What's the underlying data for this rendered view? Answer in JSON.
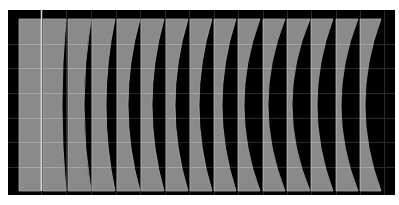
{
  "canvas": {
    "width": 399,
    "height": 205,
    "background": "#ffffff"
  },
  "panel": {
    "x": 8,
    "y": 10,
    "width": 387,
    "height": 185,
    "fill": "#000000"
  },
  "plot_area": {
    "top": 19,
    "bottom": 191
  },
  "colors": {
    "strip_fill": "#8a8a8a",
    "strip_edge": "#a8a8a8",
    "grid_on_strip": "#a4a4a4",
    "grid_on_black": "#2a2a2a",
    "highlight_line": "#d8d8d8"
  },
  "grid": {
    "horizontal_y": [
      44,
      68,
      93,
      118,
      142,
      167
    ],
    "vertical_x": [
      41,
      66,
      91,
      116,
      140,
      165,
      189,
      214,
      238,
      263,
      287,
      311,
      336,
      360,
      384
    ]
  },
  "strips": [
    {
      "left": 19,
      "top_right": 41,
      "mid_right": 41
    },
    {
      "left": 43,
      "top_right": 66,
      "mid_right": 62
    },
    {
      "left": 68,
      "top_right": 91,
      "mid_right": 84
    },
    {
      "left": 92,
      "top_right": 115,
      "mid_right": 106
    },
    {
      "left": 117,
      "top_right": 140,
      "mid_right": 128
    },
    {
      "left": 141,
      "top_right": 164,
      "mid_right": 152
    },
    {
      "left": 166,
      "top_right": 188,
      "mid_right": 175
    },
    {
      "left": 190,
      "top_right": 212,
      "mid_right": 199
    },
    {
      "left": 214,
      "top_right": 236,
      "mid_right": 222
    },
    {
      "left": 238,
      "top_right": 260,
      "mid_right": 244
    },
    {
      "left": 263,
      "top_right": 285,
      "mid_right": 268
    },
    {
      "left": 287,
      "top_right": 310,
      "mid_right": 292
    },
    {
      "left": 311,
      "top_right": 333,
      "mid_right": 317
    },
    {
      "left": 336,
      "top_right": 358,
      "mid_right": 341
    },
    {
      "left": 360,
      "top_right": 381,
      "mid_right": 365
    }
  ],
  "bright_line": {
    "x": 41,
    "y1": 10,
    "y2": 191
  }
}
